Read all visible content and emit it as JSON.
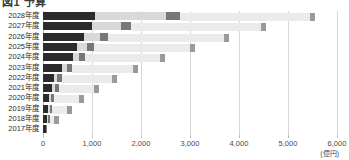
{
  "chart": {
    "title": "図1 予算",
    "unit": "(億円)"
  },
  "chart_data": {
    "type": "bar",
    "orientation": "horizontal",
    "stacked": true,
    "title": "図1 予算",
    "xlabel": "(億円)",
    "ylabel": "",
    "xlim": [
      0,
      6000
    ],
    "xticks": [
      0,
      1000,
      2000,
      3000,
      4000,
      5000,
      6000
    ],
    "xtick_labels": [
      "0",
      "1,000",
      "2,000",
      "3,000",
      "4,000",
      "5,000",
      "6,000"
    ],
    "grid": true,
    "legend": "none",
    "categories": [
      "2028年度",
      "2027年度",
      "2026年度",
      "2025年度",
      "2024年度",
      "2023年度",
      "2022年度",
      "2021年度",
      "2020年度",
      "2019年度",
      "2018年度",
      "2017年度"
    ],
    "series": [
      {
        "name": "segment-1",
        "color": "#2b2b2b",
        "values": [
          1070,
          1000,
          830,
          690,
          620,
          390,
          230,
          190,
          120,
          110,
          90,
          60
        ]
      },
      {
        "name": "segment-2",
        "color": "#d9d9d9",
        "values": [
          1440,
          600,
          330,
          210,
          120,
          90,
          60,
          50,
          40,
          30,
          20,
          0
        ]
      },
      {
        "name": "segment-3",
        "color": "#777777",
        "values": [
          290,
          190,
          160,
          140,
          120,
          110,
          90,
          80,
          60,
          50,
          40,
          20
        ]
      }
    ],
    "totals": [
      2800,
      1790,
      1320,
      1040,
      860,
      590,
      380,
      320,
      220,
      190,
      150,
      80
    ],
    "secondary_band": {
      "name": "staircase-overlay",
      "color": "#ebebeb",
      "cap_color": "#9a9a9a",
      "spans": [
        [
          2800,
          5560
        ],
        [
          1790,
          4560
        ],
        [
          1320,
          3800
        ],
        [
          1040,
          3100
        ],
        [
          860,
          2480
        ],
        [
          590,
          1930
        ],
        [
          380,
          1500
        ],
        [
          320,
          1150
        ],
        [
          220,
          840
        ],
        [
          150,
          600
        ],
        [
          90,
          330
        ],
        [
          0,
          0
        ]
      ]
    }
  }
}
